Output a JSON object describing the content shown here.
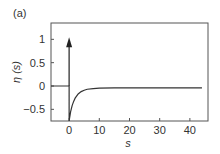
{
  "panel_label": "(a)",
  "chart_data": {
    "type": "line",
    "title": "",
    "xlabel": "s",
    "ylabel": "η (s)",
    "xlim": [
      -6,
      46
    ],
    "ylim": [
      -0.75,
      1.35
    ],
    "xticks": [
      0,
      10,
      20,
      30,
      40
    ],
    "xtick_labels": [
      "0",
      "10",
      "20",
      "30",
      "40"
    ],
    "yticks": [
      1,
      0.5,
      0,
      -0.5
    ],
    "ytick_labels": [
      "1",
      "0.5",
      "0",
      "−0.5"
    ],
    "grid": false,
    "legend": "none",
    "series": [
      {
        "name": "eta",
        "description": "zero for s<0; dips to about -0.75 at s=0+ then recovers exponentially toward ~-0.04",
        "x": [
          -6,
          0,
          0,
          0.5,
          1,
          1.5,
          2,
          3,
          4,
          5,
          6,
          8,
          10,
          15,
          20,
          30,
          40,
          44
        ],
        "y": [
          0,
          0,
          -0.75,
          -0.55,
          -0.42,
          -0.33,
          -0.26,
          -0.17,
          -0.12,
          -0.09,
          -0.07,
          -0.055,
          -0.045,
          -0.04,
          -0.04,
          -0.04,
          -0.04,
          -0.04
        ]
      }
    ],
    "annotations": [
      {
        "type": "delta-arrow",
        "x": 0,
        "y_from": 0,
        "y_to": 1.0,
        "description": "upward arrow (Dirac delta) at s=0"
      }
    ]
  }
}
